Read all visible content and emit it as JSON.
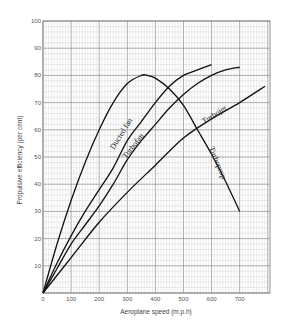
{
  "chart_data": {
    "type": "line",
    "title": "",
    "xlabel": "Aeroplane speed (m.p.h)",
    "ylabel": "Propulsive efficiency (per cent)",
    "xlim": [
      0,
      800
    ],
    "ylim": [
      0,
      100
    ],
    "xticks": [
      0,
      100,
      200,
      300,
      400,
      500,
      600,
      700
    ],
    "yticks": [
      10,
      20,
      30,
      40,
      50,
      60,
      70,
      80,
      90,
      100
    ],
    "grid": true,
    "legend": "none (curves labelled inline)",
    "series": [
      {
        "name": "Turboprop",
        "x": [
          0,
          50,
          100,
          150,
          200,
          250,
          300,
          350,
          370,
          400,
          450,
          500,
          550,
          600,
          650,
          700
        ],
        "y": [
          0,
          18,
          34,
          48,
          60,
          70,
          77,
          80,
          80,
          79,
          75,
          69,
          60,
          51,
          41,
          30
        ]
      },
      {
        "name": "Ducted fan",
        "x": [
          0,
          50,
          100,
          150,
          200,
          250,
          300,
          350,
          400,
          450,
          500,
          550,
          600
        ],
        "y": [
          0,
          11,
          21,
          30,
          38,
          46,
          56,
          63,
          70,
          76,
          80,
          82,
          84
        ]
      },
      {
        "name": "Turbofan",
        "x": [
          0,
          50,
          100,
          150,
          200,
          250,
          300,
          350,
          400,
          450,
          500,
          550,
          600,
          650,
          700
        ],
        "y": [
          0,
          9,
          18,
          25,
          32,
          40,
          49,
          56,
          62,
          68,
          73,
          77,
          80,
          82,
          83
        ]
      },
      {
        "name": "Turbojet",
        "x": [
          0,
          100,
          200,
          300,
          400,
          500,
          600,
          700,
          790
        ],
        "y": [
          0,
          13,
          26,
          37,
          47,
          57,
          64,
          70,
          76
        ]
      }
    ]
  },
  "labels": {
    "xlabel": "Aeroplane speed (m.p.h)",
    "ylabel": "Propulsive efficiency (per cent)",
    "curve_ducted_fan": "Ducted fan",
    "curve_turbofan": "Turbofan",
    "curve_turbojet": "Turbojet",
    "curve_turboprop": "Turboprop"
  },
  "style": {
    "grid_minor": "#c8c8c8",
    "grid_major": "#8a8a8a",
    "curve_color": "#111111"
  }
}
